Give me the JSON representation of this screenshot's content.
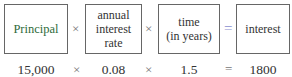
{
  "formula": {
    "boxes": [
      {
        "label": "Principal",
        "color": "#2e6b3a"
      },
      {
        "label": "annual interest rate"
      },
      {
        "label": "time (in years)"
      },
      {
        "label": "interest"
      }
    ],
    "operators": [
      "×",
      "×",
      "="
    ],
    "operator_colors": {
      "times": "#777777",
      "equals": "#8a8fd0"
    }
  },
  "example": {
    "values": [
      "15,000",
      "0.08",
      "1.5",
      "1800"
    ],
    "operators": [
      "×",
      "×",
      "="
    ]
  }
}
